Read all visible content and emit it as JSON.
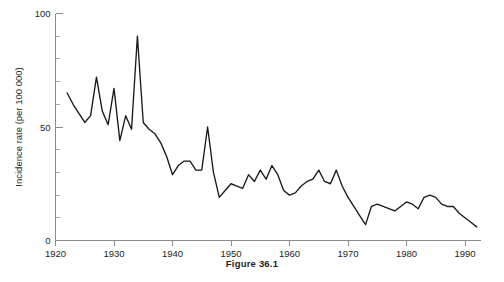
{
  "figure": {
    "caption": "Figure 36.1"
  },
  "chart_data": {
    "type": "line",
    "title": "",
    "xlabel": "",
    "ylabel": "Incidence rate (per 100 000)",
    "xlim": [
      1920,
      1993
    ],
    "ylim": [
      0,
      100
    ],
    "grid": false,
    "legend": null,
    "x_ticks": [
      1920,
      1930,
      1940,
      1950,
      1960,
      1970,
      1980,
      1990
    ],
    "x_tick_labels": [
      "1920",
      "1930",
      "1940",
      "1950",
      "1960",
      "1970",
      "1980",
      "1990"
    ],
    "y_ticks": [
      0,
      50,
      100
    ],
    "y_tick_labels": [
      "0",
      "50",
      "100"
    ],
    "y_minor_tick_step": 10,
    "line_color": "#1a1a1a",
    "series": [
      {
        "name": "Incidence rate",
        "x": [
          1922,
          1923,
          1924,
          1925,
          1926,
          1927,
          1928,
          1929,
          1930,
          1931,
          1932,
          1933,
          1934,
          1935,
          1936,
          1937,
          1938,
          1939,
          1940,
          1941,
          1942,
          1943,
          1944,
          1945,
          1946,
          1947,
          1948,
          1949,
          1950,
          1951,
          1952,
          1953,
          1954,
          1955,
          1956,
          1957,
          1958,
          1959,
          1960,
          1961,
          1962,
          1963,
          1964,
          1965,
          1966,
          1967,
          1968,
          1969,
          1970,
          1971,
          1972,
          1973,
          1974,
          1975,
          1976,
          1977,
          1978,
          1979,
          1980,
          1981,
          1982,
          1983,
          1984,
          1985,
          1986,
          1987,
          1988,
          1989,
          1990,
          1991,
          1992
        ],
        "values": [
          65,
          60,
          56,
          52,
          55,
          72,
          57,
          51,
          67,
          44,
          55,
          49,
          90,
          52,
          49,
          47,
          43,
          37,
          29,
          33,
          35,
          35,
          31,
          31,
          50,
          30,
          19,
          22,
          25,
          24,
          23,
          29,
          26,
          31,
          27,
          33,
          29,
          22,
          20,
          21,
          24,
          26,
          27,
          31,
          26,
          25,
          31,
          24,
          19,
          15,
          11,
          7,
          15,
          16,
          15,
          14,
          13,
          15,
          17,
          16,
          14,
          19,
          20,
          19,
          16,
          15,
          15,
          12,
          10,
          8,
          6
        ]
      }
    ]
  }
}
